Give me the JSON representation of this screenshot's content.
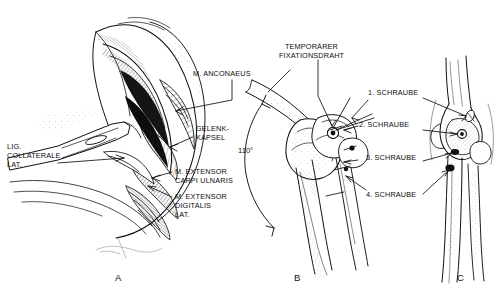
{
  "figure": {
    "background_color": "#ffffff",
    "ink_color": "#111111",
    "width": 496,
    "height": 296
  },
  "panels": [
    {
      "id": "A",
      "letter": "A",
      "caption": "Operative Darstellung des lateralen Ellenbogengelenks",
      "labels": [
        {
          "name": "m-anconaeus",
          "lines": [
            "M. ANCONAEUS"
          ]
        },
        {
          "name": "gelenkkapsel",
          "lines": [
            "GELENK-",
            "KAPSEL"
          ]
        },
        {
          "name": "lig-collaterale-lat",
          "lines": [
            "LIG.",
            "COLLATERALE",
            "LAT."
          ]
        },
        {
          "name": "m-extensor-carpi-ulnaris",
          "lines": [
            "M. EXTENSOR",
            "CARPI ULNARIS"
          ]
        },
        {
          "name": "m-extensor-digitalis-lat",
          "lines": [
            "M. EXTENSOR",
            "DIGITALIS",
            "LAT."
          ]
        }
      ]
    },
    {
      "id": "B",
      "letter": "B",
      "caption": "Seitenansicht mit temporaerem Fixationsdraht",
      "labels": [
        {
          "name": "temporaerer-fixationsdraht",
          "lines": [
            "TEMPORÄRER",
            "FIXATIONSDRAHT"
          ]
        },
        {
          "name": "schraube-1",
          "lines": [
            "1. SCHRAUBE"
          ]
        },
        {
          "name": "schraube-2",
          "lines": [
            "2. SCHRAUBE"
          ]
        },
        {
          "name": "schraube-3",
          "lines": [
            "3. SCHRAUBE"
          ]
        },
        {
          "name": "schraube-4",
          "lines": [
            "4. SCHRAUBE"
          ]
        }
      ],
      "angle_annotation": {
        "name": "flexion-angle",
        "value": "110°"
      }
    },
    {
      "id": "C",
      "letter": "C",
      "caption": "Frontalansicht der Schraubenlage"
    }
  ],
  "text": {
    "m_anconaeus": "M. ANCONAEUS",
    "gelenk": "GELENK-",
    "kapsel": "KAPSEL",
    "lig": "LIG.",
    "collaterale": "COLLATERALE",
    "lat": "LAT.",
    "m_extensor_1": "M. EXTENSOR",
    "carpi_ulnaris": "CARPI ULNARIS",
    "m_extensor_2": "M. EXTENSOR",
    "digitalis": "DIGITALIS",
    "lat2": "LAT.",
    "temporaerer": "TEMPORÄRER",
    "fixationsdraht": "FIXATIONSDRAHT",
    "schraube1": "1. SCHRAUBE",
    "schraube2": "2. SCHRAUBE",
    "schraube3": "3. SCHRAUBE",
    "schraube4": "4. SCHRAUBE",
    "angle": "110°",
    "letter_a": "A",
    "letter_b": "B",
    "letter_c": "C"
  }
}
